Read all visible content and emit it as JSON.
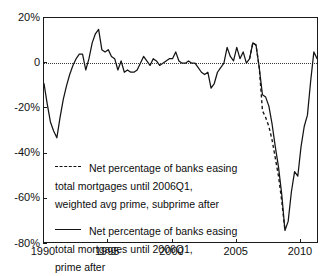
{
  "chart_data": {
    "type": "line",
    "title": "",
    "xlabel": "",
    "ylabel": "",
    "xlim": [
      1990.0,
      2011.4
    ],
    "ylim": [
      -80,
      20
    ],
    "grid": "zero-line-only",
    "legend_position": "center-left-inside",
    "y_ticks": [
      {
        "value": 20,
        "label": "20%"
      },
      {
        "value": 0,
        "label": "0"
      },
      {
        "value": -20,
        "label": "-20%"
      },
      {
        "value": -40,
        "label": "-40%"
      },
      {
        "value": -60,
        "label": "-60%"
      },
      {
        "value": -80,
        "label": "-80%"
      }
    ],
    "x_ticks": [
      {
        "value": 1990,
        "label": "1990"
      },
      {
        "value": 1995,
        "label": "1995"
      },
      {
        "value": 2000,
        "label": "2000"
      },
      {
        "value": 2005,
        "label": "2005"
      },
      {
        "value": 2010,
        "label": "2010"
      }
    ],
    "units": "percent",
    "series": [
      {
        "name": "Net percentage of banks easing\ntotal mortgages until 2006Q1,\nprime after",
        "style": "solid",
        "color": "#141414",
        "x": [
          1990.0,
          1990.25,
          1990.5,
          1990.75,
          1991.0,
          1991.25,
          1991.5,
          1991.75,
          1992.0,
          1992.25,
          1992.5,
          1992.75,
          1993.0,
          1993.25,
          1993.5,
          1993.75,
          1994.0,
          1994.25,
          1994.5,
          1994.75,
          1995.0,
          1995.25,
          1995.5,
          1995.75,
          1996.0,
          1996.25,
          1996.5,
          1996.75,
          1997.0,
          1997.25,
          1997.5,
          1997.75,
          1998.0,
          1998.25,
          1998.5,
          1998.75,
          1999.0,
          1999.25,
          1999.5,
          1999.75,
          2000.0,
          2000.25,
          2000.5,
          2000.75,
          2001.0,
          2001.25,
          2001.5,
          2001.75,
          2002.0,
          2002.25,
          2002.5,
          2002.75,
          2003.0,
          2003.25,
          2003.5,
          2003.75,
          2004.0,
          2004.25,
          2004.5,
          2004.75,
          2005.0,
          2005.25,
          2005.5,
          2005.75,
          2006.0,
          2006.25,
          2006.5,
          2006.75,
          2007.0,
          2007.25,
          2007.5,
          2007.75,
          2008.0,
          2008.25,
          2008.5,
          2008.75,
          2009.0,
          2009.25,
          2009.5,
          2009.75,
          2010.0,
          2010.25,
          2010.5,
          2010.75,
          2011.0,
          2011.25
        ],
        "values": [
          -9,
          -18,
          -26,
          -30,
          -33,
          -24,
          -16,
          -10,
          -5,
          -1,
          2,
          4,
          4,
          -3,
          2,
          9,
          13,
          15,
          6,
          5,
          6,
          3,
          2,
          -3,
          1,
          -4,
          -3,
          -4,
          -4,
          -3,
          0,
          3,
          1,
          -1,
          2,
          1,
          -1,
          0,
          1,
          2,
          2,
          5,
          1,
          0,
          0,
          1,
          0,
          0,
          -2,
          -4,
          -5,
          -4,
          -11,
          -9,
          -4,
          -2,
          0,
          7,
          3,
          1,
          7,
          2,
          5,
          0,
          2,
          9,
          8,
          -2,
          -14,
          -15,
          -19,
          -27,
          -37,
          -46,
          -58,
          -74,
          -70,
          -57,
          -48,
          -50,
          -37,
          -28,
          -23,
          -8,
          5,
          2
        ]
      },
      {
        "name": "Net percentage of banks easing\ntotal mortgages until 2006Q1,\nweighted avg prime, subprime after",
        "style": "dashed",
        "color": "#141414",
        "x": [
          2006.0,
          2006.25,
          2006.5,
          2006.75,
          2007.0,
          2007.25,
          2007.5,
          2007.75,
          2008.0,
          2008.25,
          2008.5,
          2008.75
        ],
        "values": [
          2,
          9,
          8,
          -2,
          -21,
          -24,
          -28,
          -34,
          -42,
          -50,
          -61,
          -74
        ]
      }
    ],
    "legend": [
      {
        "style": "dashed",
        "label": "Net percentage of banks easing\ntotal mortgages until 2006Q1,\nweighted avg prime, subprime after"
      },
      {
        "style": "solid",
        "label": "Net percentage of banks easing\ntotal mortgages until 2006Q1,\nprime after"
      }
    ]
  }
}
